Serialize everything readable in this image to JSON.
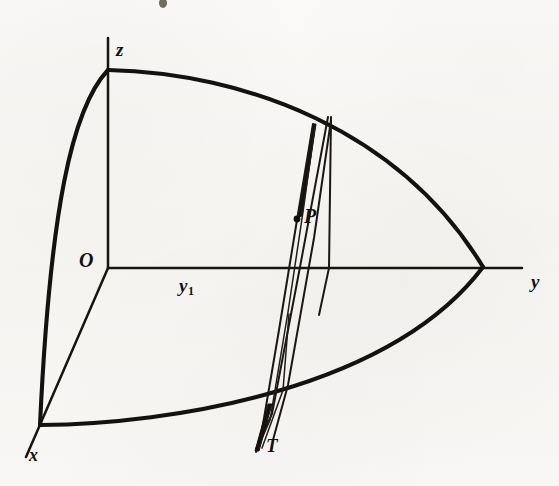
{
  "figure": {
    "background_color": "#f7f6f4",
    "ink_color": "#141210",
    "width": 559,
    "height": 486
  },
  "labels": {
    "z_axis": "z",
    "y_axis": "y",
    "x_axis": "x",
    "origin": "O",
    "y_sub1": "y",
    "y_sub1_subscript": "1",
    "point_p": "P",
    "point_t": "T"
  },
  "geometry": {
    "origin": {
      "x": 108,
      "y": 268
    },
    "z_axis_tip": {
      "x": 108,
      "y": 38
    },
    "y_axis_tip": {
      "x": 522,
      "y": 268
    },
    "x_axis_tip": {
      "x": 26,
      "y": 457
    },
    "sphere_pole_z": {
      "x": 108,
      "y": 70
    },
    "sphere_pole_x": {
      "x": 40,
      "y": 425
    },
    "sphere_pole_y": {
      "x": 483,
      "y": 267
    },
    "point_p": {
      "x": 297,
      "y": 220
    },
    "point_t": {
      "x": 256,
      "y": 449
    },
    "section_apex": {
      "x": 330,
      "y": 117
    },
    "section_y_crossing": {
      "x": 328,
      "y": 267
    }
  },
  "artifacts": {
    "ink_speck_top": {
      "x": 163,
      "y": 3
    }
  }
}
